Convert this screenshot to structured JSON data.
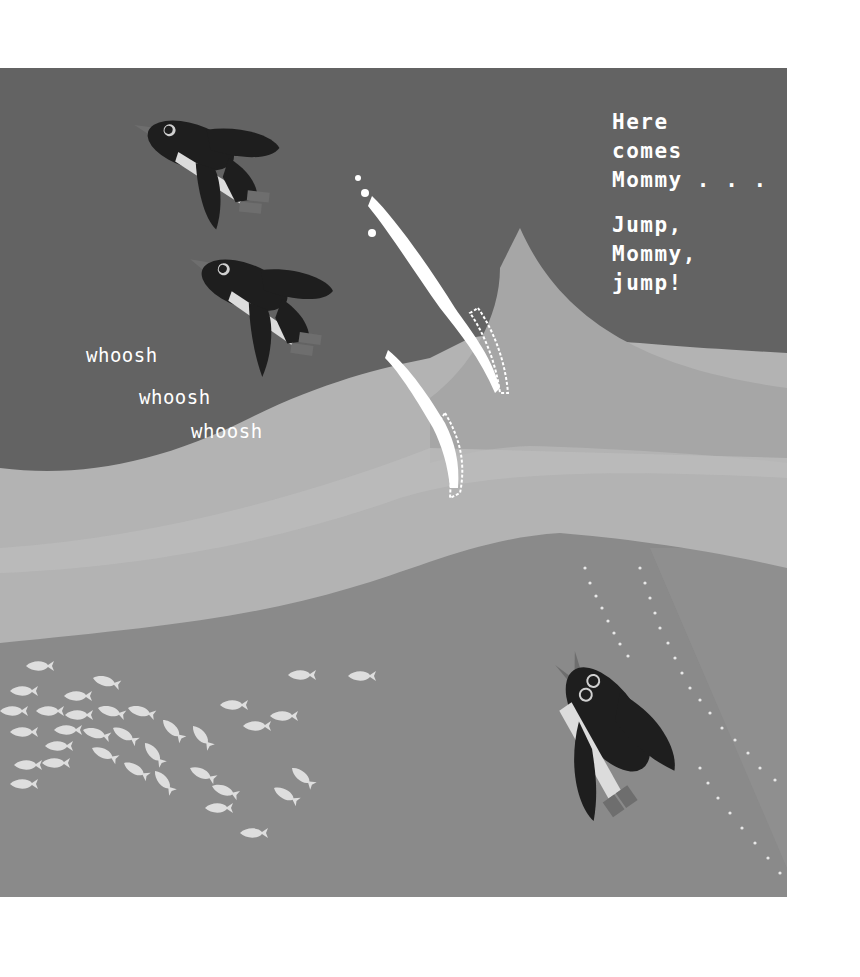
{
  "page": {
    "type": "picture-book-illustration",
    "colors": {
      "deep_water": "#636363",
      "lower_water": "#8a8a8a",
      "wave_light": "#b3b3b3",
      "wave_mid": "#a0a0a0",
      "spray": "#ffffff",
      "penguin_body": "#1e1e1e",
      "penguin_belly": "#dcdcdc",
      "penguin_feet": "#6e6e6e",
      "fish": "#dedede"
    }
  },
  "narration": {
    "lines": [
      "Here",
      "comes",
      "Mommy . . ."
    ],
    "lines2": [
      "Jump,",
      "Mommy,",
      "jump!"
    ]
  },
  "sound_effects": {
    "words": [
      "whoosh",
      "whoosh",
      "whoosh"
    ]
  },
  "illustration": {
    "penguins": [
      {
        "label": "jumping penguin 1",
        "position": "top-left"
      },
      {
        "label": "jumping penguin 2",
        "position": "upper-middle"
      },
      {
        "label": "mommy penguin swimming",
        "position": "lower-right"
      }
    ],
    "fish_school": {
      "label": "school of fish",
      "count": 30
    },
    "waves": {
      "label": "splashing waves"
    }
  }
}
